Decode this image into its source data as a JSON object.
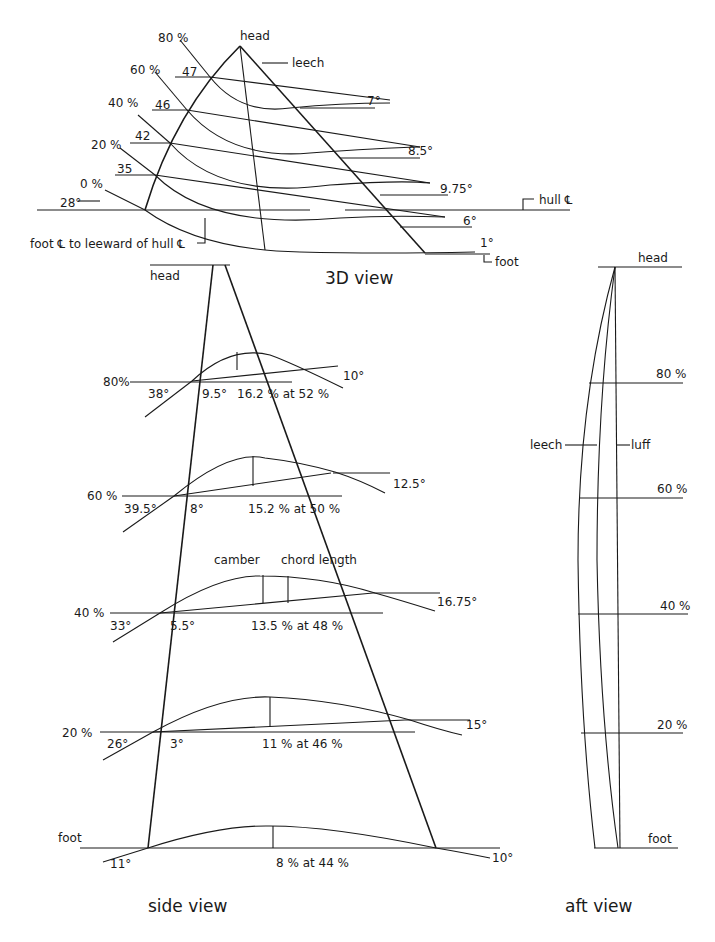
{
  "view_3d": {
    "title": "3D view",
    "head_label": "head",
    "leech_label": "leech",
    "hull_label": "hull ℄",
    "foot_label": "foot",
    "foot_note": "foot ℄ to leeward of hull ℄",
    "stations": [
      {
        "label": "80 %",
        "entry_angle": "47",
        "twist": "7°"
      },
      {
        "label": "60 %",
        "entry_angle": "46",
        "twist": "8.5°"
      },
      {
        "label": "40 %",
        "entry_angle": "42",
        "twist": "9.75°"
      },
      {
        "label": "20 %",
        "entry_angle": "35",
        "twist": "6°"
      },
      {
        "label": "0 %",
        "entry_angle": "28°",
        "twist": "1°"
      }
    ]
  },
  "side_view": {
    "title": "side view",
    "head_label": "head",
    "camber_label": "camber",
    "chord_label": "chord length",
    "stations": [
      {
        "label": "80%",
        "entry_angle": "38°",
        "chord_angle": "9.5°",
        "camber": "16.2 % at 52 %",
        "exit_angle": "10°"
      },
      {
        "label": "60 %",
        "entry_angle": "39.5°",
        "chord_angle": "8°",
        "camber": "15.2 % at 50 %",
        "exit_angle": "12.5°"
      },
      {
        "label": "40 %",
        "entry_angle": "33°",
        "chord_angle": "5.5°",
        "camber": "13.5 % at 48 %",
        "exit_angle": "16.75°"
      },
      {
        "label": "20 %",
        "entry_angle": "26°",
        "chord_angle": "3°",
        "camber": "11 % at 46 %",
        "exit_angle": "15°"
      },
      {
        "label": "foot",
        "entry_angle": "11°",
        "chord_angle": "",
        "camber": "8 % at 44 %",
        "exit_angle": "10°"
      }
    ]
  },
  "aft_view": {
    "title": "aft view",
    "head_label": "head",
    "leech_label": "leech",
    "luff_label": "luff",
    "stations": [
      "80 %",
      "60 %",
      "40 %",
      "20 %",
      "foot"
    ]
  }
}
